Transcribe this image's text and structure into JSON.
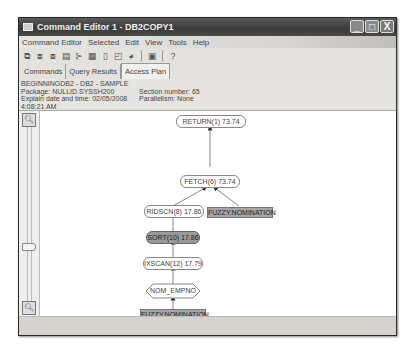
{
  "window": {
    "title": "Command Editor 1 - DB2COPY1",
    "buttons": {
      "minimize": "_",
      "maximize": "□",
      "close": "X"
    }
  },
  "menu": {
    "items": [
      "Command Editor",
      "Selected",
      "Edit",
      "View",
      "Tools",
      "Help"
    ]
  },
  "toolbar": {
    "icons": [
      "execute-icon",
      "execute-explain-icon",
      "explain-icon",
      "script-icon",
      "options-icon",
      "database-icon",
      "clear-icon",
      "memo-icon",
      "task-icon",
      "window-icon",
      "help-icon"
    ]
  },
  "tabs": [
    {
      "label": "Commands",
      "active": false
    },
    {
      "label": "Query Results",
      "active": false
    },
    {
      "label": "Access Plan",
      "active": true
    }
  ],
  "info": {
    "line1": "BEGINNINGDB2 - DB2 - SAMPLE",
    "package": "Package: NULLID.SYSSH200",
    "section": "Section number: 65",
    "explain_date": "Explain date and time: 02/05/2008 4:08:21 AM",
    "parallelism": "Parallelism: None",
    "total_cost": "Total cost(timerons): 73.74"
  },
  "zoom": {
    "zoom_in": "+",
    "zoom_out": "-"
  },
  "plan": {
    "nodes": [
      {
        "id": "return",
        "label": "RETURN(1) 73.74",
        "type": "operator"
      },
      {
        "id": "fetch",
        "label": "FETCH(6) 73.74",
        "type": "operator"
      },
      {
        "id": "ridscn",
        "label": "RIDSCN(8) 17.86",
        "type": "operator"
      },
      {
        "id": "table1",
        "label": "FUZZY.NOMINATION",
        "type": "table"
      },
      {
        "id": "sort",
        "label": "SORT(10) 17.86",
        "type": "operator-selected"
      },
      {
        "id": "ixscan",
        "label": "IXSCAN(12) 17.79",
        "type": "operator"
      },
      {
        "id": "index",
        "label": "NOM_EMPNO",
        "type": "index"
      },
      {
        "id": "table2",
        "label": "FUZZY.NOMINATION",
        "type": "table"
      }
    ]
  }
}
